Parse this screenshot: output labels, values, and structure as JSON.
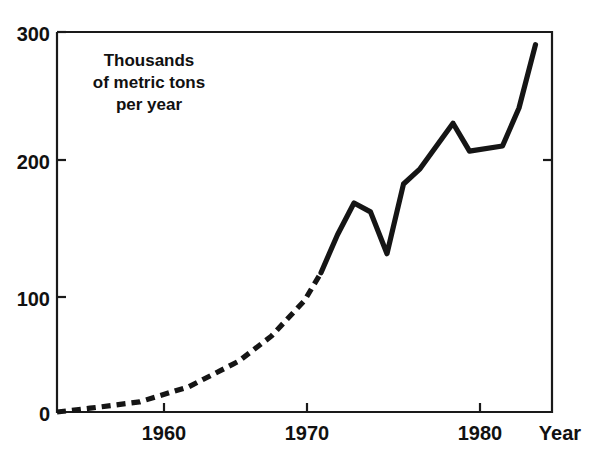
{
  "chart_data": {
    "type": "line",
    "title": "",
    "subtitle": "",
    "xlabel": "Year",
    "ylabel": "",
    "annotation": "Thousands\nof metric tons\nper year",
    "annotation_lines": [
      "Thousands",
      "of metric tons",
      "per year"
    ],
    "xlim": [
      1955,
      1985
    ],
    "ylim": [
      0,
      300
    ],
    "xticks": [
      1960,
      1970,
      1980
    ],
    "xtick_labels": [
      "1960",
      "1970",
      "1980"
    ],
    "yticks": [
      0,
      100,
      200,
      300
    ],
    "ytick_labels": [
      "0",
      "100",
      "200",
      "300"
    ],
    "grid": false,
    "legend": null,
    "units": "thousands of metric tons per year",
    "series": [
      {
        "name": "Production",
        "style": "dashed-then-solid",
        "dashed_until_x": 1971,
        "color": "#151515",
        "x": [
          1955,
          1957,
          1960,
          1963,
          1966,
          1968,
          1970,
          1971,
          1972,
          1973,
          1974,
          1975,
          1976,
          1977,
          1979,
          1980,
          1982,
          1983,
          1984
        ],
        "values": [
          0,
          3,
          8,
          20,
          40,
          60,
          88,
          110,
          140,
          165,
          158,
          125,
          180,
          192,
          228,
          206,
          210,
          240,
          290
        ]
      }
    ]
  },
  "axis": {
    "x_title": "Year"
  }
}
